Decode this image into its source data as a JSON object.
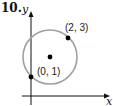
{
  "problem": {
    "number": "10."
  },
  "axes": {
    "x_label": "x",
    "y_label": "y"
  },
  "points": [
    {
      "label": "(2, 3)",
      "x": 2,
      "y": 3
    },
    {
      "label": "(0, 1)",
      "x": 0,
      "y": 1
    }
  ],
  "circle": {
    "center_marked": true,
    "stroke_color": "#a0a0a0"
  },
  "colors": {
    "axis": "#111111",
    "circle": "#a0a0a0",
    "point": "#000000"
  }
}
